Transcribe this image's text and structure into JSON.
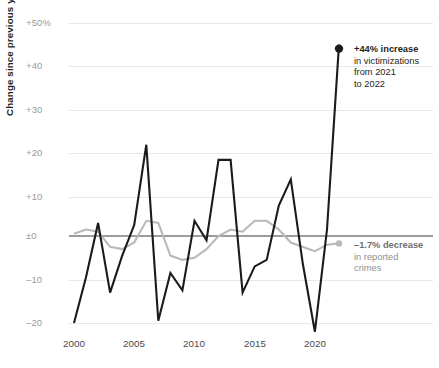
{
  "axes": {
    "y_title": "Change since previous year",
    "y_ticks": [
      "+50%",
      "+40",
      "+30",
      "+20",
      "+10",
      "±0",
      "–10",
      "–20"
    ],
    "x_ticks": [
      "2000",
      "2005",
      "2010",
      "2015",
      "2020"
    ]
  },
  "annotations": {
    "increase": {
      "line1": "+44% increase",
      "line2": "in victimizations",
      "line3": "from 2021",
      "line4": "to 2022"
    },
    "decrease": {
      "line1": "–1.7% decrease",
      "line2": "in reported",
      "line3": "crimes"
    }
  },
  "colors": {
    "dark_series": "#1b1b1b",
    "grey_series": "#b9b9b9",
    "gridline": "#e8e8e8",
    "zeroline": "#3a3a3a",
    "tick_text": "#9a9a9a"
  },
  "chart_data": {
    "type": "line",
    "title": "",
    "xlabel": "",
    "ylabel": "Change since previous year",
    "xlim": [
      2000,
      2022
    ],
    "ylim": [
      -22,
      50
    ],
    "grid": "horizontal",
    "legend": "annotations",
    "x": [
      2000,
      2001,
      2002,
      2003,
      2004,
      2005,
      2006,
      2007,
      2008,
      2009,
      2010,
      2011,
      2012,
      2013,
      2014,
      2015,
      2016,
      2017,
      2018,
      2019,
      2020,
      2021,
      2022
    ],
    "series": [
      {
        "name": "Victimizations (survey)",
        "color": "#1b1b1b",
        "values": [
          -20,
          -9.5,
          3,
          -13,
          -4.5,
          2.5,
          21,
          -19.5,
          -8.5,
          -12.5,
          3.5,
          -1,
          17.5,
          17.5,
          -13,
          -7,
          -5.5,
          7,
          13,
          -6.5,
          -22,
          1.5,
          44
        ],
        "end_marker": true,
        "end_label": "+44% increase in victimizations from 2021 to 2022"
      },
      {
        "name": "Reported crimes (police data)",
        "color": "#b9b9b9",
        "values": [
          0.5,
          1.5,
          1.0,
          -2.5,
          -3.0,
          -1.5,
          3.5,
          3.0,
          -4.5,
          -5.5,
          -5.0,
          -3.0,
          0.0,
          1.5,
          1.0,
          3.5,
          3.5,
          1.5,
          -1.5,
          -2.5,
          -3.5,
          -2.0,
          -1.7
        ],
        "end_marker": true,
        "end_label": "–1.7% decrease in reported crimes"
      }
    ]
  }
}
